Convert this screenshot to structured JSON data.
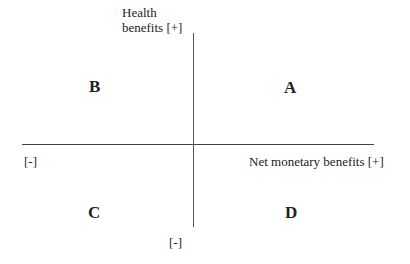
{
  "axes": {
    "y_positive_label_line1": "Health",
    "y_positive_label_line2": "benefits [+]",
    "y_negative_label": "[-]",
    "x_positive_label": "Net monetary benefits [+]",
    "x_negative_label": "[-]"
  },
  "quadrants": {
    "top_right": "A",
    "top_left": "B",
    "bottom_left": "C",
    "bottom_right": "D"
  },
  "colors": {
    "axis_line": "#444444",
    "text": "#222222",
    "background": "#ffffff"
  }
}
